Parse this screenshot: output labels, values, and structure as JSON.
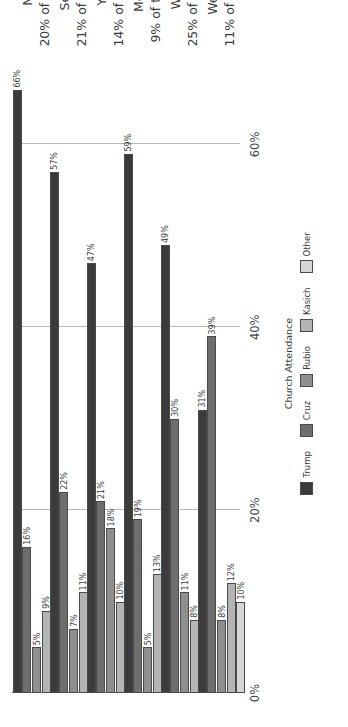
{
  "chart_data": {
    "type": "bar",
    "orientation": "horizontal-grouped",
    "title": "",
    "xlabel": "",
    "ylabel": "",
    "legend_title": "Church Attendance",
    "legend_position": "bottom",
    "grid": true,
    "xlim": [
      0,
      70
    ],
    "xticks": [
      0,
      20,
      40,
      60
    ],
    "xtick_labels": [
      "0%",
      "20%",
      "40%",
      "60%"
    ],
    "value_suffix": "%",
    "categories": [
      "Never",
      "Seldom",
      "Yearly",
      "Monthly",
      "Weekly",
      "Weekly+"
    ],
    "category_sublabels": [
      "20% of the Sample",
      "21% of the Sample",
      "14% of the Sample",
      "9% of the Sample",
      "25% of the Sample",
      "11% of the Sample"
    ],
    "series": [
      {
        "name": "Trump",
        "color": "#3b3b3b",
        "values": [
          66,
          57,
          47,
          59,
          49,
          31
        ]
      },
      {
        "name": "Cruz",
        "color": "#6e6e6e",
        "values": [
          16,
          22,
          21,
          19,
          30,
          39
        ]
      },
      {
        "name": "Rubio",
        "color": "#8f8f8f",
        "values": [
          5,
          7,
          18,
          5,
          11,
          8
        ]
      },
      {
        "name": "Kasich",
        "color": "#b4b4b4",
        "values": [
          9,
          11,
          10,
          13,
          8,
          12
        ]
      },
      {
        "name": "Other",
        "color": "#d6d6d6",
        "values": [
          3,
          3,
          4,
          5,
          4,
          10
        ]
      }
    ],
    "value_labels": [
      [
        "66%",
        "16%",
        "5%",
        "9%",
        "3%"
      ],
      [
        "57%",
        "22%",
        "7%",
        "11%",
        "3%"
      ],
      [
        "47%",
        "21%",
        "18%",
        "10%",
        "4%"
      ],
      [
        "59%",
        "19%",
        "5%",
        "13%",
        "5%"
      ],
      [
        "49%",
        "30%",
        "11%",
        "8%",
        "4%"
      ],
      [
        "31%",
        "39%",
        "8%",
        "12%",
        "10%"
      ]
    ]
  }
}
